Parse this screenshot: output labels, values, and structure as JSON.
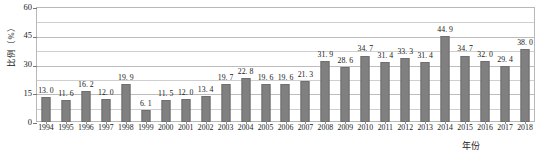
{
  "chart_data": {
    "type": "bar",
    "title": "",
    "subtitle": "",
    "xlabel": "年份",
    "ylabel": "比例（%）",
    "ylim": [
      0,
      60
    ],
    "yticks": [
      0,
      15,
      30,
      45,
      60
    ],
    "ytick_labels": [
      "0",
      "15",
      "30",
      "45",
      "60"
    ],
    "minor_gridline_step": 7.5,
    "grid": true,
    "legend": false,
    "bar_color": "#808080",
    "bar_edge_color": "#6f6f6f",
    "data_labels": true,
    "categories": [
      "1994",
      "1995",
      "1996",
      "1997",
      "1998",
      "1999",
      "2000",
      "2001",
      "2002",
      "2003",
      "2004",
      "2005",
      "2006",
      "2007",
      "2008",
      "2009",
      "2010",
      "2011",
      "2012",
      "2013",
      "2014",
      "2015",
      "2016",
      "2017",
      "2018"
    ],
    "values": [
      13.0,
      11.6,
      16.2,
      12.0,
      19.9,
      6.1,
      11.5,
      12.0,
      13.4,
      19.7,
      22.8,
      19.6,
      19.6,
      21.3,
      31.9,
      28.6,
      34.7,
      31.4,
      33.3,
      31.4,
      44.9,
      34.7,
      32.0,
      29.4,
      38.0
    ],
    "value_labels": [
      "13. 0",
      "11. 6",
      "16. 2",
      "12. 0",
      "19. 9",
      "6. 1",
      "11. 5",
      "12. 0",
      "13. 4",
      "19. 7",
      "22. 8",
      "19. 6",
      "19. 6",
      "21. 3",
      "31. 9",
      "28. 6",
      "34. 7",
      "31. 4",
      "33. 3",
      "31. 4",
      "44. 9",
      "34. 7",
      "32. 0",
      "29. 4",
      "38. 0"
    ]
  }
}
